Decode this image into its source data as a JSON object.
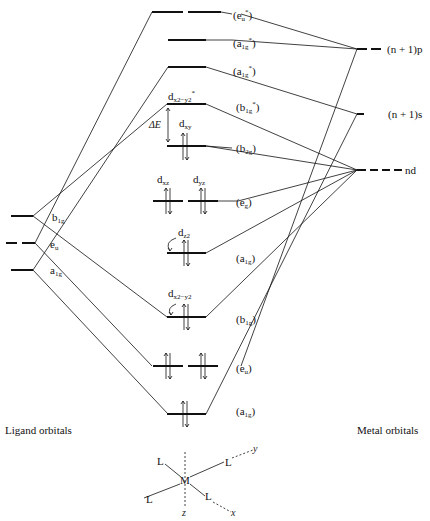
{
  "diagram": {
    "type": "molecular-orbital-diagram",
    "captions": {
      "ligand": "Ligand orbitals",
      "metal": "Metal orbitals"
    },
    "metal_orbitals": {
      "np": "(n + 1)p",
      "ns": "(n + 1)s",
      "nd": "nd"
    },
    "ligand_orbitals": {
      "b1g": "b",
      "b1g_sub": "1g",
      "eu": "e",
      "eu_sub": "u",
      "a1g": "a",
      "a1g_sub": "1g"
    },
    "mo_levels": [
      {
        "id": "eu_star",
        "base": "(e",
        "sub": "u",
        "sup": "*",
        "close": ")"
      },
      {
        "id": "a1g_star_upper",
        "base": "(a",
        "sub": "1g",
        "sup": "*",
        "close": ")"
      },
      {
        "id": "a1g_star_lower",
        "base": "(a",
        "sub": "1g",
        "sup": "*",
        "close": ")"
      },
      {
        "id": "b1g_star",
        "base": "(b",
        "sub": "1g",
        "sup": "*",
        "close": ")"
      },
      {
        "id": "b2g",
        "base": "(b",
        "sub": "2g",
        "sup": "",
        "close": ")"
      },
      {
        "id": "eg",
        "base": "(e",
        "sub": "g",
        "sup": "",
        "close": ")"
      },
      {
        "id": "a1g",
        "base": "(a",
        "sub": "1g",
        "sup": "",
        "close": ")"
      },
      {
        "id": "b1g",
        "base": "(b",
        "sub": "1g",
        "sup": "",
        "close": ")"
      },
      {
        "id": "eu",
        "base": "(e",
        "sub": "u",
        "sup": "",
        "close": ")"
      },
      {
        "id": "a1g_bottom",
        "base": "(a",
        "sub": "1g",
        "sup": "",
        "close": ")"
      }
    ],
    "d_orbital_labels": {
      "dx2y2_star": {
        "base": "d",
        "sub": "x2−y2",
        "sup": "*"
      },
      "dxy": {
        "base": "d",
        "sub": "xy"
      },
      "dxz": {
        "base": "d",
        "sub": "xz"
      },
      "dyz": {
        "base": "d",
        "sub": "yz"
      },
      "dz2": {
        "base": "d",
        "sub": "z2"
      },
      "dx2y2": {
        "base": "d",
        "sub": "x2−y2"
      }
    },
    "splitting_label": "ΔE",
    "geometry": {
      "metal": "M",
      "ligand": "L",
      "axes": {
        "x": "x",
        "y": "y",
        "z": "z"
      }
    }
  }
}
